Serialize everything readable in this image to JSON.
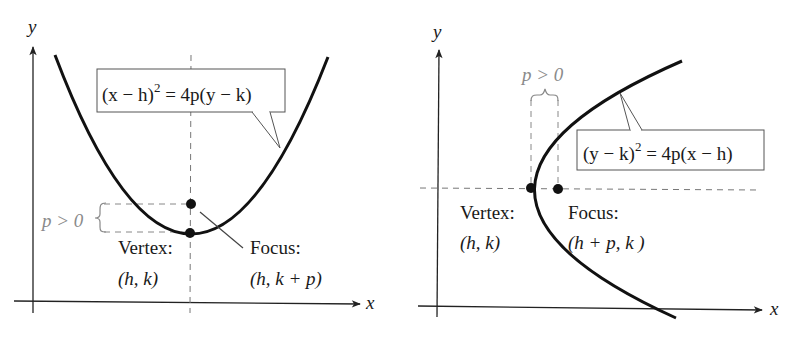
{
  "figures": [
    {
      "id": "vertical-axis-parabola",
      "axis_labels": {
        "x": "x",
        "y": "y"
      },
      "equation": {
        "lhs": "(x − h)",
        "exp": "2",
        "rhs": " = 4p(y − k)"
      },
      "condition": "p > 0",
      "vertex": {
        "title": "Vertex:",
        "coords": "(h, k)"
      },
      "focus": {
        "title": "Focus:",
        "coords": "(h, k + p)"
      }
    },
    {
      "id": "horizontal-axis-parabola",
      "axis_labels": {
        "x": "x",
        "y": "y"
      },
      "equation": {
        "lhs": "(y − k)",
        "exp": "2",
        "rhs": " = 4p(x − h)"
      },
      "condition": "p > 0",
      "vertex": {
        "title": "Vertex:",
        "coords": "(h, k)"
      },
      "focus": {
        "title": "Focus:",
        "coords": "(h + p, k )"
      }
    }
  ],
  "colors": {
    "ink": "#111111",
    "gray": "#8a8a8a",
    "dash": "#7a7a7a",
    "background": "#ffffff"
  }
}
